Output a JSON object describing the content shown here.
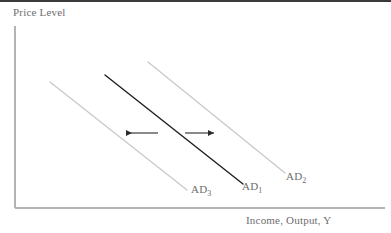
{
  "figure": {
    "type": "economics-diagram",
    "width": 391,
    "height": 233,
    "background_color": "#ffffff",
    "top_strip_color": "#3a3a3a"
  },
  "axes": {
    "y_title": "Price Level",
    "x_title": "Income, Output, Y",
    "axis_color": "#b3b3b3",
    "origin": {
      "x": 15,
      "y": 208
    },
    "y_top": 26,
    "x_right": 385
  },
  "curves": [
    {
      "id": "ad3",
      "label_text": "AD",
      "label_sub": "3",
      "color": "#c9c9c9",
      "width": 1.3,
      "x1": 50,
      "y1": 82,
      "x2": 187,
      "y2": 190,
      "label_x": 191,
      "label_y": 183
    },
    {
      "id": "ad1",
      "label_text": "AD",
      "label_sub": "1",
      "color": "#1f1f1f",
      "width": 1.4,
      "x1": 105,
      "y1": 75,
      "x2": 243,
      "y2": 184,
      "label_x": 242,
      "label_y": 180
    },
    {
      "id": "ad2",
      "label_text": "AD",
      "label_sub": "2",
      "color": "#c9c9c9",
      "width": 1.3,
      "x1": 148,
      "y1": 62,
      "x2": 285,
      "y2": 173,
      "label_x": 286,
      "label_y": 170
    }
  ],
  "arrows": [
    {
      "id": "leftward-shift-arrow",
      "direction": "left",
      "color": "#2b2b2b",
      "x_tail": 158,
      "x_head": 122,
      "y": 133
    },
    {
      "id": "rightward-shift-arrow",
      "direction": "right",
      "color": "#2b2b2b",
      "x_tail": 185,
      "x_head": 218,
      "y": 133
    }
  ],
  "chart_data": {
    "type": "line",
    "title": "",
    "xlabel": "Income, Output, Y",
    "ylabel": "Price Level",
    "grid": false,
    "legend": "inline-curve-labels",
    "axis_ticks": [],
    "series": [
      {
        "name": "AD3",
        "display_name": "AD₃",
        "color": "#c9c9c9",
        "description": "Leftward-shifted aggregate demand curve",
        "points": [
          [
            50,
            82
          ],
          [
            187,
            190
          ]
        ]
      },
      {
        "name": "AD1",
        "display_name": "AD₁",
        "color": "#1f1f1f",
        "description": "Original aggregate demand curve",
        "points": [
          [
            105,
            75
          ],
          [
            243,
            184
          ]
        ]
      },
      {
        "name": "AD2",
        "display_name": "AD₂",
        "color": "#c9c9c9",
        "description": "Rightward-shifted aggregate demand curve",
        "points": [
          [
            148,
            62
          ],
          [
            285,
            173
          ]
        ]
      }
    ],
    "annotations": [
      {
        "text": "leftward shift",
        "type": "arrow",
        "direction": "left",
        "at": [
          122,
          133
        ]
      },
      {
        "text": "rightward shift",
        "type": "arrow",
        "direction": "right",
        "at": [
          218,
          133
        ]
      }
    ]
  }
}
